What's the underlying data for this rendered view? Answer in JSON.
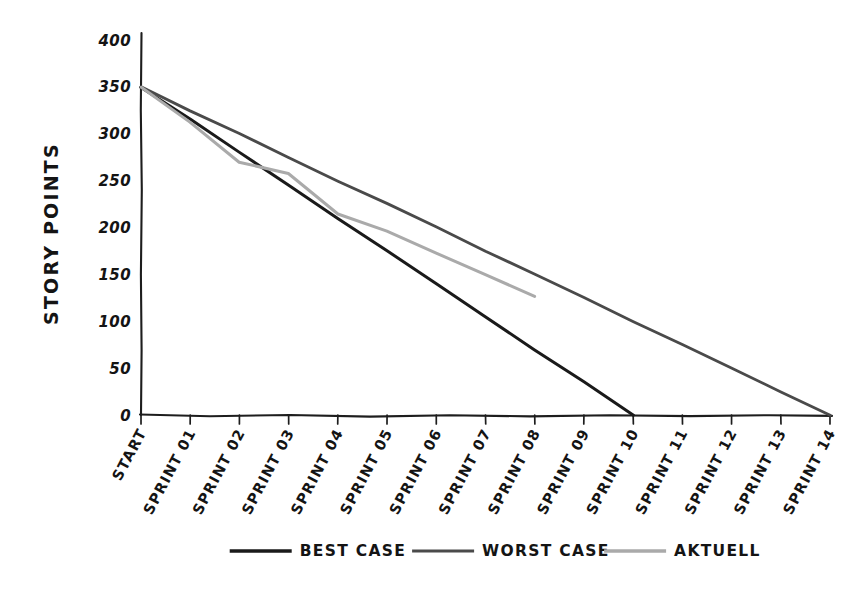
{
  "chart_data": {
    "type": "line",
    "title": "",
    "xlabel": "",
    "ylabel": "STORY POINTS",
    "ylim": [
      0,
      400
    ],
    "yticks": [
      0,
      50,
      100,
      150,
      200,
      250,
      300,
      350,
      400
    ],
    "grid": false,
    "legend_position": "bottom",
    "categories": [
      "START",
      "SPRINT 01",
      "SPRINT 02",
      "SPRINT 03",
      "SPRINT 04",
      "SPRINT 05",
      "SPRINT 06",
      "SPRINT 07",
      "SPRINT 08",
      "SPRINT 09",
      "SPRINT 10",
      "SPRINT 11",
      "SPRINT 12",
      "SPRINT 13",
      "SPRINT 14"
    ],
    "series": [
      {
        "name": "BEST CASE",
        "color": "#1a1a1a",
        "width": 3.0,
        "values": [
          350,
          315,
          280,
          245,
          210,
          175,
          140,
          105,
          70,
          35,
          0,
          null,
          null,
          null,
          null
        ]
      },
      {
        "name": "WORST CASE",
        "color": "#4a4a4a",
        "width": 2.8,
        "values": [
          350,
          325,
          300,
          275,
          250,
          225,
          200,
          175,
          150,
          125,
          100,
          75,
          50,
          25,
          0
        ]
      },
      {
        "name": "AKTUELL",
        "color": "#aaaaaa",
        "width": 3.0,
        "values": [
          350,
          312,
          270,
          258,
          214,
          196,
          173,
          150,
          127,
          null,
          null,
          null,
          null,
          null,
          null
        ]
      }
    ]
  },
  "legend": {
    "items": [
      {
        "label": "BEST CASE",
        "color": "#1a1a1a",
        "width": 3.4
      },
      {
        "label": "WORST CASE",
        "color": "#4a4a4a",
        "width": 3.2
      },
      {
        "label": "AKTUELL",
        "color": "#aaaaaa",
        "width": 3.4
      }
    ]
  },
  "axes": {
    "y_title": "STORY POINTS"
  }
}
